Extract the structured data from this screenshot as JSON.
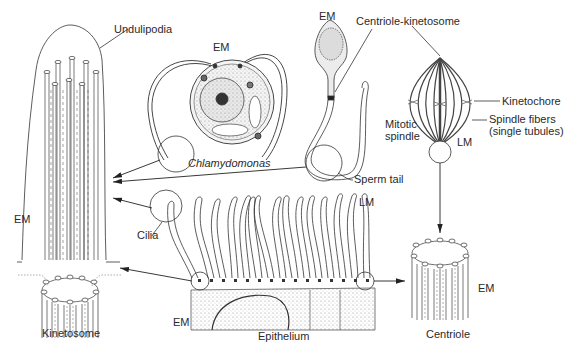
{
  "figure": {
    "panels": {
      "undulipodia": {
        "title": "Undulipodia",
        "scale": "EM"
      },
      "chlamydomonas": {
        "name": "Chlamydomonas",
        "scale": "EM"
      },
      "sperm": {
        "scale": "EM",
        "centriole_label": "Centriole-kinetosome",
        "tail_label": "Sperm tail"
      },
      "mitotic_spindle": {
        "name": "Mitotic spindle",
        "name_line1": "Mitotic",
        "name_line2": "spindle",
        "kinetochore": "Kinetochore",
        "spindle_fibers_line1": "Spindle fibers",
        "spindle_fibers_line2": "(single tubules)",
        "scale": "LM"
      },
      "cilia": {
        "label": "Cilia",
        "scale_top": "LM",
        "scale_bottom": "EM"
      },
      "epithelium": {
        "label": "Epithelium"
      },
      "kinetosome": {
        "label": "Kinetosome"
      },
      "centriole": {
        "label": "Centriole",
        "scale": "EM"
      }
    }
  }
}
